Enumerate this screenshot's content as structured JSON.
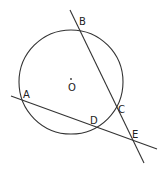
{
  "diagram": {
    "type": "geometry",
    "stroke_color": "#333333",
    "circle": {
      "center": {
        "label": "O",
        "x": 71,
        "y": 82
      },
      "r": 52
    },
    "lines": [
      {
        "name": "line-BE",
        "x1": 70,
        "y1": 10,
        "x2": 144,
        "y2": 163
      },
      {
        "name": "line-AE",
        "x1": 11,
        "y1": 96,
        "x2": 157,
        "y2": 149
      }
    ],
    "points": [
      {
        "label": "B",
        "x": 78,
        "y": 27,
        "lx": 79,
        "ly": 25
      },
      {
        "label": "A",
        "x": 23,
        "y": 100,
        "lx": 23,
        "ly": 98
      },
      {
        "label": "C",
        "x": 116,
        "y": 106,
        "lx": 118,
        "ly": 113
      },
      {
        "label": "D",
        "x": 95,
        "y": 125,
        "lx": 90,
        "ly": 124
      },
      {
        "label": "E",
        "x": 132,
        "y": 140,
        "lx": 132,
        "ly": 138
      }
    ],
    "center_label": {
      "text": "O",
      "x": 68,
      "y": 91
    }
  }
}
